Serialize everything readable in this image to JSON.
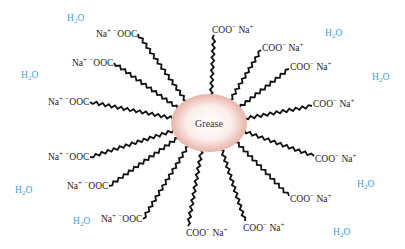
{
  "diagram": {
    "center": {
      "label": "Grease",
      "fill_center": "#ffffff",
      "fill_edge": "#eab9b0"
    },
    "water_color": "#3aa3d6",
    "water_label": {
      "main": "H",
      "sub": "2",
      "tail": "O"
    },
    "outer_groups_left": [
      {
        "text": "Na",
        "charge": "+",
        "anion": " −OOC",
        "x": 96,
        "y": 28
      },
      {
        "text": "Na",
        "charge": "+",
        "anion": " −OOC",
        "x": 72,
        "y": 57
      },
      {
        "text": "Na",
        "charge": "+",
        "anion": " −OOC",
        "x": 48,
        "y": 96
      },
      {
        "text": "Na",
        "charge": "+",
        "anion": " −OOC",
        "x": 48,
        "y": 151
      },
      {
        "text": "Na",
        "charge": "+",
        "anion": " −OOC",
        "x": 67,
        "y": 180
      },
      {
        "text": "Na",
        "charge": "+",
        "anion": " −OOC",
        "x": 101,
        "y": 213
      }
    ],
    "outer_groups_right": [
      {
        "text": "COO− ",
        "charge": "+",
        "cation": "Na",
        "x": 212,
        "y": 24
      },
      {
        "text": "COO− ",
        "charge": "+",
        "cation": "Na",
        "x": 262,
        "y": 42
      },
      {
        "text": "COO− ",
        "charge": "+",
        "cation": "Na",
        "x": 290,
        "y": 61
      },
      {
        "text": "COO− ",
        "charge": "+",
        "cation": "Na",
        "x": 313,
        "y": 98
      },
      {
        "text": "COO− ",
        "charge": "+",
        "cation": "Na",
        "x": 315,
        "y": 153
      },
      {
        "text": "COO− ",
        "charge": "+",
        "cation": "Na",
        "x": 290,
        "y": 193
      },
      {
        "text": "COO− ",
        "charge": "+",
        "cation": "Na",
        "x": 243,
        "y": 222
      },
      {
        "text": "COO− ",
        "charge": "+",
        "cation": "Na",
        "x": 186,
        "y": 227
      }
    ],
    "water_positions": [
      {
        "x": 67,
        "y": 14
      },
      {
        "x": 21,
        "y": 71
      },
      {
        "x": 15,
        "y": 186
      },
      {
        "x": 73,
        "y": 217
      },
      {
        "x": 325,
        "y": 29
      },
      {
        "x": 372,
        "y": 73
      },
      {
        "x": 357,
        "y": 180
      },
      {
        "x": 333,
        "y": 228
      }
    ]
  }
}
